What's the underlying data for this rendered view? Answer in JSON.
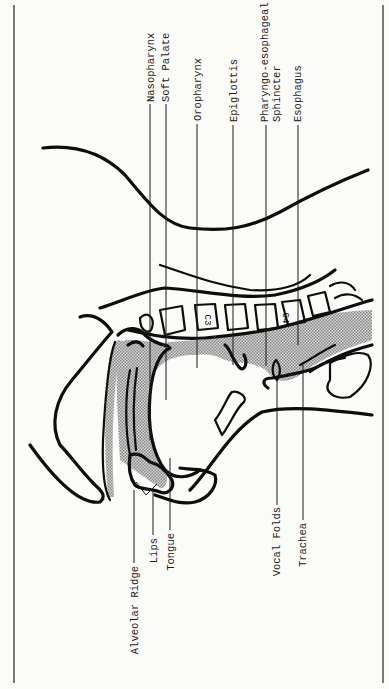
{
  "figure": {
    "orientation": "rotated-counterclockwise",
    "vertebra_labels": [
      "C3",
      "C4"
    ],
    "labels_top": [
      {
        "id": "nasopharynx",
        "text": "Nasopharynx"
      },
      {
        "id": "soft-palate",
        "text": "Soft Palate"
      },
      {
        "id": "oropharynx",
        "text": "Oropharynx"
      },
      {
        "id": "epiglottis",
        "text": "Epiglottis"
      },
      {
        "id": "pe-sphincter-1",
        "text": "Pharyngo-esophageal"
      },
      {
        "id": "pe-sphincter-2",
        "text": "Sphincter"
      },
      {
        "id": "esophagus",
        "text": "Esophagus"
      }
    ],
    "labels_bottom": [
      {
        "id": "alveolar-ridge",
        "text": "Alveolar Ridge"
      },
      {
        "id": "lips",
        "text": "Lips"
      },
      {
        "id": "tongue",
        "text": "Tongue"
      },
      {
        "id": "vocal-folds",
        "text": "Vocal Folds"
      },
      {
        "id": "trachea",
        "text": "Trachea"
      }
    ],
    "colors": {
      "ink": "#0d0d0d",
      "paper": "#fbfbf8",
      "shading": "#b8b8b8"
    }
  }
}
